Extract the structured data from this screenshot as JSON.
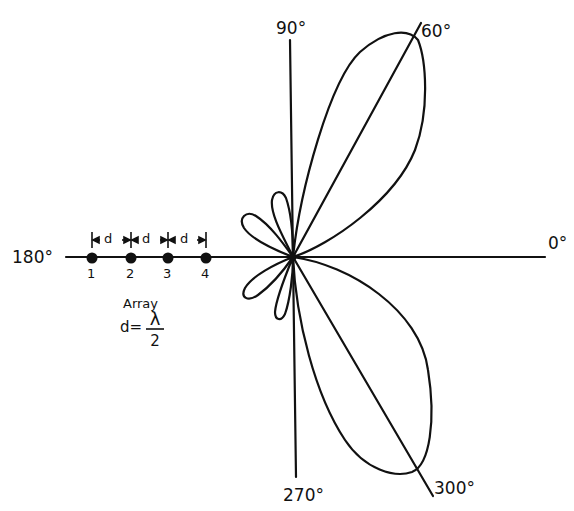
{
  "diagram": {
    "type": "polar radiation pattern of a linear antenna array",
    "angle_labels": {
      "deg_0": "0°",
      "deg_60": "60°",
      "deg_90": "90°",
      "deg_180": "180°",
      "deg_270": "270°",
      "deg_300": "300°"
    },
    "array": {
      "elements": [
        "1",
        "2",
        "3",
        "4"
      ],
      "spacing_label": "d",
      "caption": "Array",
      "formula_lhs": "d=",
      "formula_num": "λ",
      "formula_den": "2"
    },
    "lobes": [
      {
        "name": "main-lobe-60",
        "direction_deg": 60
      },
      {
        "name": "main-lobe-300",
        "direction_deg": 300
      },
      {
        "name": "side-lobe-upper-1",
        "direction_deg": 110
      },
      {
        "name": "side-lobe-upper-2",
        "direction_deg": 150
      },
      {
        "name": "side-lobe-lower-1",
        "direction_deg": 210
      },
      {
        "name": "side-lobe-lower-2",
        "direction_deg": 250
      }
    ],
    "colors": {
      "ink": "#111111",
      "paper": "#ffffff"
    }
  }
}
